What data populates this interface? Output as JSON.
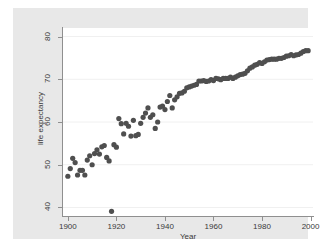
{
  "chart_data": {
    "type": "scatter",
    "title": "",
    "xlabel": "Year",
    "ylabel": "life expectancy",
    "xlim": [
      1898,
      2001
    ],
    "ylim": [
      38,
      82
    ],
    "xticks": [
      1900,
      1920,
      1940,
      1960,
      1980,
      2000
    ],
    "yticks": [
      40,
      50,
      60,
      70,
      80
    ],
    "grid": "horizontal",
    "legend": "none",
    "marker": {
      "shape": "circle",
      "size": 2.6,
      "color": "#4f4f4f"
    },
    "series": [
      {
        "name": "life expectancy",
        "x": [
          1900,
          1901,
          1902,
          1903,
          1904,
          1905,
          1906,
          1907,
          1908,
          1909,
          1910,
          1911,
          1912,
          1913,
          1914,
          1915,
          1916,
          1917,
          1918,
          1919,
          1920,
          1921,
          1922,
          1923,
          1924,
          1925,
          1926,
          1927,
          1928,
          1929,
          1930,
          1931,
          1932,
          1933,
          1934,
          1935,
          1936,
          1937,
          1938,
          1939,
          1940,
          1941,
          1942,
          1943,
          1944,
          1945,
          1946,
          1947,
          1948,
          1949,
          1950,
          1951,
          1952,
          1953,
          1954,
          1955,
          1956,
          1957,
          1958,
          1959,
          1960,
          1961,
          1962,
          1963,
          1964,
          1965,
          1966,
          1967,
          1968,
          1969,
          1970,
          1971,
          1972,
          1973,
          1974,
          1975,
          1976,
          1977,
          1978,
          1979,
          1980,
          1981,
          1982,
          1983,
          1984,
          1985,
          1986,
          1987,
          1988,
          1989,
          1990,
          1991,
          1992,
          1993,
          1994,
          1995,
          1996,
          1997,
          1998,
          1999
        ],
        "y": [
          47.3,
          49.1,
          51.5,
          50.5,
          47.6,
          48.7,
          48.7,
          47.6,
          51.1,
          52.1,
          50.0,
          52.6,
          53.5,
          52.5,
          54.2,
          54.5,
          51.7,
          50.9,
          39.1,
          54.7,
          54.1,
          60.8,
          59.6,
          57.2,
          59.7,
          59.0,
          56.7,
          60.4,
          56.8,
          57.1,
          59.7,
          61.1,
          62.1,
          63.3,
          61.1,
          61.7,
          58.5,
          60.0,
          63.5,
          63.7,
          62.9,
          64.8,
          66.2,
          63.3,
          65.2,
          65.9,
          66.7,
          66.8,
          67.2,
          68.0,
          68.2,
          68.4,
          68.6,
          68.8,
          69.6,
          69.6,
          69.7,
          69.5,
          69.6,
          69.9,
          69.7,
          70.2,
          70.1,
          69.9,
          70.2,
          70.2,
          70.2,
          70.5,
          70.2,
          70.5,
          70.8,
          71.1,
          71.2,
          71.4,
          72.0,
          72.6,
          72.9,
          73.3,
          73.5,
          73.9,
          73.7,
          74.1,
          74.5,
          74.6,
          74.7,
          74.7,
          74.7,
          74.9,
          74.9,
          75.1,
          75.4,
          75.5,
          75.8,
          75.5,
          75.7,
          75.8,
          76.1,
          76.5,
          76.7,
          76.7
        ]
      }
    ],
    "annotations": [
      {
        "label": "1918 influenza pandemic outlier",
        "x": 1918,
        "y": 39.1
      }
    ]
  },
  "axes": {
    "x_title": "Year",
    "y_title": "life expectancy",
    "x_tick_labels": [
      "1900",
      "1920",
      "1940",
      "1960",
      "1980",
      "2000"
    ],
    "y_tick_labels": [
      "40",
      "50",
      "60",
      "70",
      "80"
    ]
  },
  "colors": {
    "marker": "#4f4f4f",
    "graph_background": "#e8e8e8",
    "plot_background": "#ffffff",
    "axis": "#8f8f8f",
    "gridline": "#f0f0f0",
    "text": "#3a3a3a"
  }
}
